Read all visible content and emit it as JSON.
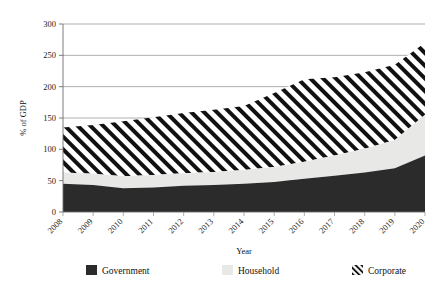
{
  "chart_data": {
    "type": "area",
    "stacked": true,
    "title": "",
    "xlabel": "Year",
    "ylabel": "% of GDP",
    "x": [
      2008,
      2009,
      2010,
      2011,
      2012,
      2013,
      2014,
      2015,
      2016,
      2017,
      2018,
      2019,
      2020
    ],
    "categories": [
      "2008",
      "2009",
      "2010",
      "2011",
      "2012",
      "2013",
      "2014",
      "2015",
      "2016",
      "2017",
      "2018",
      "2019",
      "2020"
    ],
    "xtick_labels": [
      "2008",
      "2009",
      "2010",
      "2011",
      "2012",
      "2013",
      "2014",
      "2015",
      "2016",
      "2017",
      "2018",
      "2019",
      "2020"
    ],
    "ytick_labels": [
      "0",
      "50",
      "100",
      "150",
      "200",
      "250",
      "300"
    ],
    "yticks": [
      0,
      50,
      100,
      150,
      200,
      250,
      300
    ],
    "ylim": [
      0,
      300
    ],
    "xlim": [
      2008,
      2020
    ],
    "grid": "horizontal",
    "legend_position": "bottom",
    "series": [
      {
        "name": "Government",
        "fill": "solid-dark",
        "color": "#2b2b2b",
        "values": [
          45,
          43,
          38,
          39,
          42,
          43,
          45,
          48,
          53,
          58,
          63,
          70,
          90
        ]
      },
      {
        "name": "Household",
        "fill": "solid-light",
        "color": "#e8e8e6",
        "values": [
          18,
          18,
          19,
          20,
          20,
          21,
          22,
          24,
          27,
          32,
          38,
          45,
          65
        ]
      },
      {
        "name": "Corporate",
        "fill": "diagonal-hatch",
        "color": "#ffffff",
        "hatch_color": "#111111",
        "values": [
          72,
          78,
          88,
          92,
          96,
          99,
          102,
          118,
          132,
          125,
          122,
          120,
          115
        ]
      }
    ],
    "totals": [
      135,
      139,
      145,
      151,
      158,
      163,
      169,
      190,
      212,
      215,
      223,
      235,
      270
    ]
  },
  "legend": {
    "items": [
      {
        "label": "Government",
        "swatch": "solid-dark"
      },
      {
        "label": "Household",
        "swatch": "solid-light"
      },
      {
        "label": "Corporate",
        "swatch": "diagonal-hatch"
      }
    ]
  },
  "colors": {
    "government": "#2b2b2b",
    "household": "#e8e8e6",
    "corporate_hatch": "#111111",
    "grid": "#8c8c8c",
    "axis": "#6e6e6e",
    "text": "#1a1a1a",
    "background": "#ffffff"
  }
}
